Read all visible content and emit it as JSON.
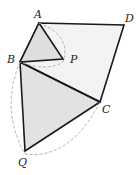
{
  "diagram": {
    "points": {
      "A": {
        "label": "A",
        "x": 39,
        "y": 23
      },
      "D": {
        "label": "D",
        "x": 124,
        "y": 25
      },
      "B": {
        "label": "B",
        "x": 20,
        "y": 62
      },
      "P": {
        "label": "P",
        "x": 63,
        "y": 59
      },
      "C": {
        "label": "C",
        "x": 100,
        "y": 102
      },
      "Q": {
        "label": "Q",
        "x": 25,
        "y": 151
      }
    },
    "colors": {
      "stroke": "#1a1a1a",
      "fill_light": "#f2f2f2",
      "fill_shaded": "#e0e0e0",
      "dashed": "#b0b0b0"
    }
  }
}
